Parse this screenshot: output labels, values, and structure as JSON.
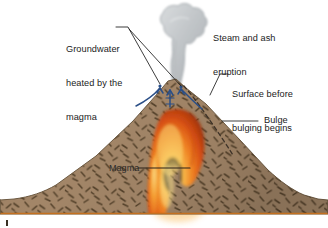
{
  "figure": {
    "width": 328,
    "height": 228,
    "background": "#ffffff"
  },
  "labels": {
    "groundwater": {
      "line1": "Groundwater",
      "line2": "heated by the",
      "line3": "magma"
    },
    "steam": {
      "line1": "Steam and ash",
      "line2": "eruption"
    },
    "surface": {
      "line1": "Surface before",
      "line2": "bulging begins"
    },
    "bulge": "Bulge",
    "magma": "Magma"
  },
  "colors": {
    "rock_fill": "#a38668",
    "rock_fill_dark": "#8d7254",
    "rock_speck": "#54412a",
    "rock_outline": "#6d5a42",
    "ground_line": "#c4701f",
    "steam_fill": "#c3c7ca",
    "steam_edge": "#9aa0a5",
    "magma_outer": "#8c2f10",
    "magma_mid": "#e0561a",
    "magma_inner": "#f6a93a",
    "magma_core": "#fbe08a",
    "water_arrow": "#2b4f87",
    "leader_line": "#1b1b1b",
    "dashed_surface": "#3d3228",
    "text": "#1b1b1b"
  },
  "elements": {
    "steam_plume": "steam-and-ash-plume",
    "volcano_body": "volcano-rock-body",
    "magma_chamber": "magma-chamber",
    "groundwater_arrows": "groundwater-flow-arrows",
    "former_surface": "dashed-former-surface-line",
    "ground_layer": "ground-base-layer"
  }
}
